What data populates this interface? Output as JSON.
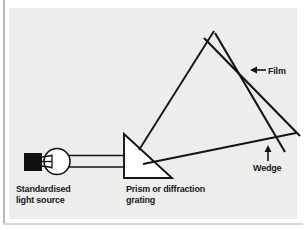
{
  "figure": {
    "background_color": "#ededeb",
    "page_color": "#ffffff",
    "ink_color": "#141414",
    "rule_color": "#b9b9b9"
  },
  "labels": {
    "light_source": "Standardised\nlight source",
    "prism": "Prism or diffraction\ngrating",
    "film": "Film",
    "wedge": "Wedge"
  },
  "components": {
    "lamp_housing": "lamp-housing",
    "bulb": "light-bulb",
    "filament": "filament",
    "beam": "light-beam",
    "prism": "prism-triangle",
    "film": "film-plane",
    "wedge": "wedge-plate",
    "ray_upper": "dispersed-ray-upper",
    "ray_lower": "dispersed-ray-lower"
  },
  "annotations": {
    "film_arrow": "arrow-left",
    "wedge_arrow": "arrow-up"
  }
}
